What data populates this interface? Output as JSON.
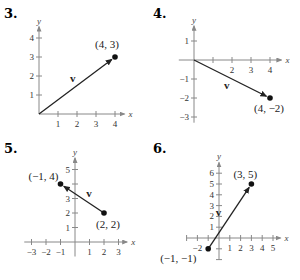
{
  "chart_data": [
    {
      "type": "line",
      "title": "3.",
      "xlabel": "x",
      "ylabel": "y",
      "xlim": [
        0,
        4.5
      ],
      "ylim": [
        0,
        4.6
      ],
      "x_ticks": [
        1,
        2,
        3,
        4
      ],
      "x_tick_labels": [
        "1",
        "2",
        "3",
        "4"
      ],
      "y_ticks": [
        1,
        2,
        3,
        4
      ],
      "y_tick_labels": [
        "1",
        "2",
        "3",
        "4"
      ],
      "vector": {
        "label": "v",
        "from": [
          0,
          0
        ],
        "to": [
          4,
          3
        ],
        "dot_at": "to"
      },
      "point_labels": [
        {
          "text": "(4, 3)",
          "at": [
            4,
            3
          ]
        }
      ]
    },
    {
      "type": "line",
      "title": "4.",
      "xlabel": "x",
      "ylabel": "y",
      "xlim": [
        -0.8,
        4.6
      ],
      "ylim": [
        -3.3,
        1.8
      ],
      "x_ticks": [
        1,
        2,
        3,
        4
      ],
      "x_tick_labels": [
        "",
        "2",
        "3",
        "4"
      ],
      "y_ticks": [
        1,
        -1,
        -2,
        -3
      ],
      "y_tick_labels": [
        "1",
        "−1",
        "−2",
        "−3"
      ],
      "vector": {
        "label": "v",
        "from": [
          0,
          0
        ],
        "to": [
          4,
          -2
        ],
        "dot_at": "to"
      },
      "point_labels": [
        {
          "text": "(4, −2)",
          "at": [
            4,
            -2
          ]
        }
      ]
    },
    {
      "type": "line",
      "title": "5.",
      "xlabel": "x",
      "ylabel": "y",
      "xlim": [
        -3.5,
        3.6
      ],
      "ylim": [
        -1,
        5.8
      ],
      "x_ticks": [
        -3,
        -2,
        -1,
        1,
        2,
        3
      ],
      "x_tick_labels": [
        "−3",
        "−2",
        "−1",
        "1",
        "2",
        "3"
      ],
      "y_ticks": [
        1,
        2,
        3,
        4,
        5
      ],
      "y_tick_labels": [
        "1",
        "2",
        "3",
        "",
        "5"
      ],
      "vector": {
        "label": "v",
        "from": [
          2,
          2
        ],
        "to": [
          -1,
          4
        ],
        "dot_at": "both"
      },
      "point_labels": [
        {
          "text": "(−1, 4)",
          "at": [
            -1,
            4
          ]
        },
        {
          "text": "(2, 2)",
          "at": [
            2,
            2
          ]
        }
      ]
    },
    {
      "type": "line",
      "title": "6.",
      "xlabel": "x",
      "ylabel": "y",
      "xlim": [
        -3,
        5.7
      ],
      "ylim": [
        -2,
        7
      ],
      "x_ticks": [
        -3,
        -2,
        -1,
        1,
        2,
        3,
        4,
        5
      ],
      "x_tick_labels": [
        "",
        "−2",
        "",
        "1",
        "2",
        "3",
        "4",
        "5"
      ],
      "y_ticks": [
        -2,
        -1,
        1,
        2,
        3,
        4,
        5,
        6
      ],
      "y_tick_labels": [
        "",
        "",
        "1",
        "2",
        "3",
        "4",
        "5",
        "6"
      ],
      "vector": {
        "label": "v",
        "from": [
          -1,
          -1
        ],
        "to": [
          3,
          5
        ],
        "dot_at": "both"
      },
      "point_labels": [
        {
          "text": "(3, 5)",
          "at": [
            3,
            5
          ]
        },
        {
          "text": "(−1, −1)",
          "at": [
            -1,
            -1
          ]
        }
      ]
    }
  ]
}
